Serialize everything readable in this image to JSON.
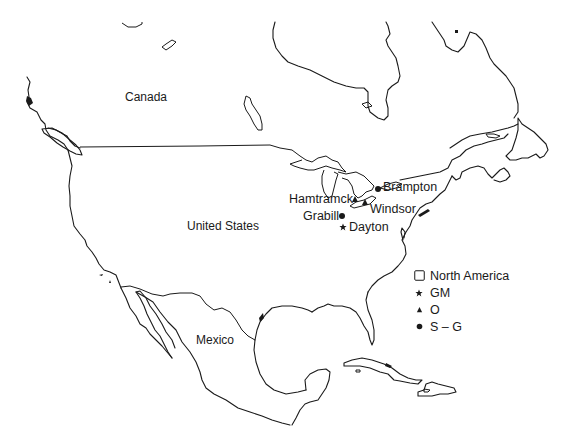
{
  "map": {
    "region": "North America",
    "countries": [
      {
        "name": "Canada",
        "x": 125,
        "y": 91
      },
      {
        "name": "United States",
        "x": 187,
        "y": 220
      },
      {
        "name": "Mexico",
        "x": 196,
        "y": 334
      }
    ],
    "sites": [
      {
        "name": "Brampton",
        "group": "S-G",
        "symbol": "circle",
        "marker_x": 378,
        "marker_y": 189,
        "label_x": 383,
        "label_y": 181
      },
      {
        "name": "Hamtramck",
        "group": "O",
        "symbol": "triangle",
        "marker_x": 355,
        "marker_y": 199,
        "label_x": 289,
        "label_y": 193
      },
      {
        "name": "Windsor",
        "group": "O",
        "symbol": "triangle",
        "marker_x": 365,
        "marker_y": 202,
        "label_x": 370,
        "label_y": 203
      },
      {
        "name": "Grabill",
        "group": "S-G",
        "symbol": "circle",
        "marker_x": 342,
        "marker_y": 216,
        "label_x": 303,
        "label_y": 210
      },
      {
        "name": "Dayton",
        "group": "GM",
        "symbol": "star",
        "marker_x": 343,
        "marker_y": 227,
        "label_x": 349,
        "label_y": 221
      }
    ],
    "colors": {
      "ink": "#1a1a1a",
      "background": "#ffffff"
    }
  },
  "legend": {
    "items": [
      {
        "symbol": "square-outline",
        "label": "North America"
      },
      {
        "symbol": "star",
        "label": "GM"
      },
      {
        "symbol": "triangle",
        "label": "O"
      },
      {
        "symbol": "circle",
        "label": "S – G"
      }
    ]
  }
}
